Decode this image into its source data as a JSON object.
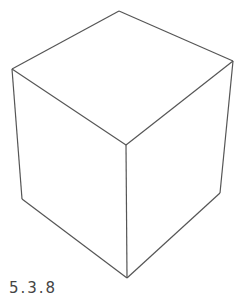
{
  "figure": {
    "label": "5.3.8",
    "stroke_color": "#555555",
    "background": "#ffffff",
    "cube": {
      "vertices": {
        "top_back": [
          119,
          11
        ],
        "top_left": [
          12,
          69
        ],
        "top_right": [
          233,
          61
        ],
        "top_front": [
          126,
          145
        ],
        "bottom_left": [
          22,
          199
        ],
        "bottom_right": [
          220,
          193
        ],
        "bottom_front": [
          127,
          278
        ]
      }
    }
  }
}
